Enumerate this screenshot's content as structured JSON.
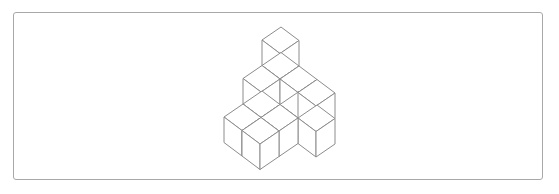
{
  "figure": {
    "type": "isometric-cube-stack",
    "cube_count_visible_structure": 12,
    "stroke_color": "#8c8c8c",
    "face_color": "#ffffff",
    "frame_color": "#a8a8a8",
    "projection": {
      "origin": [
        281,
        103.5
      ],
      "a": [
        18,
        13.5
      ],
      "b": [
        -19,
        13
      ],
      "c": [
        0,
        -25.5
      ]
    },
    "cubes": [
      [
        0,
        0,
        0
      ],
      [
        0,
        0,
        1
      ],
      [
        0,
        0,
        2
      ],
      [
        0,
        1,
        0
      ],
      [
        0,
        1,
        1
      ],
      [
        1,
        0,
        0
      ],
      [
        1,
        0,
        1
      ],
      [
        2,
        0,
        0
      ],
      [
        2,
        0,
        1
      ],
      [
        1,
        1,
        0
      ],
      [
        0,
        2,
        0
      ],
      [
        1,
        2,
        0
      ]
    ]
  }
}
